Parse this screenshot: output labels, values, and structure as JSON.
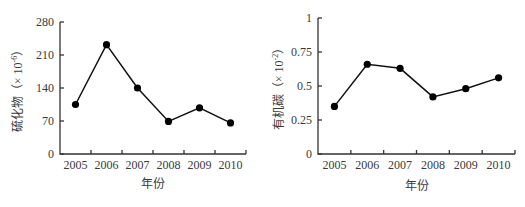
{
  "chart_data": [
    {
      "type": "line",
      "title": "",
      "xlabel": "年份",
      "ylabel": "硫化物（×10⁻⁶）",
      "ylabel_main": "硫化物（× 10",
      "ylabel_sup": "-6",
      "ylabel_close": "）",
      "categories": [
        "2005",
        "2006",
        "2007",
        "2008",
        "2009",
        "2010"
      ],
      "series": [
        {
          "name": "硫化物",
          "values": [
            105,
            232,
            140,
            69,
            98,
            66
          ]
        }
      ],
      "ylim": [
        0,
        280
      ],
      "yticks": [
        "0",
        "70",
        "140",
        "210",
        "280"
      ],
      "grid": false,
      "legend": "none",
      "marker": "filled-circle"
    },
    {
      "type": "line",
      "title": "",
      "xlabel": "年份",
      "ylabel": "有机碳（×10⁻²）",
      "ylabel_main": "有机碳（× 10",
      "ylabel_sup": "-2",
      "ylabel_close": "）",
      "categories": [
        "2005",
        "2006",
        "2007",
        "2008",
        "2009",
        "2010"
      ],
      "series": [
        {
          "name": "有机碳",
          "values": [
            0.35,
            0.66,
            0.63,
            0.42,
            0.48,
            0.56
          ]
        }
      ],
      "ylim": [
        0,
        1
      ],
      "yticks": [
        "0",
        "0.25",
        "0.5",
        "0.75",
        "1"
      ],
      "grid": false,
      "legend": "none",
      "marker": "filled-circle"
    }
  ]
}
